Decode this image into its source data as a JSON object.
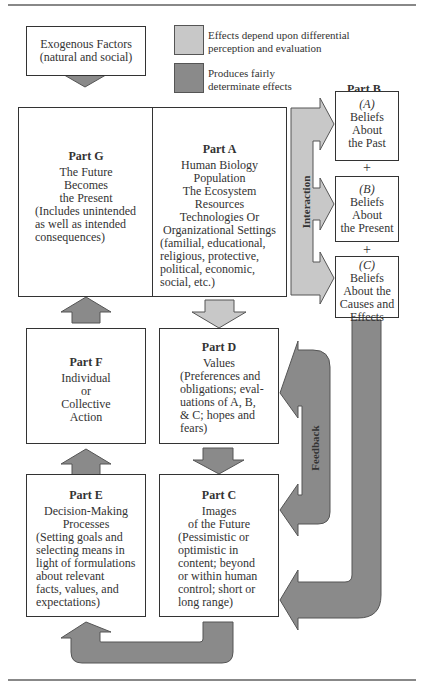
{
  "colors": {
    "light_arrow": "#c8c8c8",
    "dark_arrow": "#8a8a8a",
    "border": "#333333"
  },
  "legend": {
    "light": {
      "icon": "light-gray-swatch",
      "lines": [
        "Effects depend upon differential",
        "perception and evaluation"
      ]
    },
    "dark": {
      "icon": "dark-gray-swatch",
      "lines": [
        "Produces fairly",
        "determinate effects"
      ]
    }
  },
  "exogenous": {
    "lines": [
      "Exogenous Factors",
      "(natural and social)"
    ]
  },
  "part_g": {
    "title": "Part G",
    "lines": [
      "The Future",
      "Becomes",
      "the Present",
      "(Includes unintended",
      "as well as intended",
      "consequences)"
    ]
  },
  "part_a": {
    "title": "Part A",
    "lines": [
      "Human Biology",
      "Population",
      "The Ecosystem",
      "Resources",
      "Technologies Or",
      "Organizational Settings",
      "(familial, educational,",
      "religious, protective,",
      "political, economic,",
      "social, etc.)"
    ]
  },
  "part_b": {
    "title": "Part B",
    "a": {
      "label": "(A)",
      "lines": [
        "Beliefs",
        "About",
        "the Past"
      ]
    },
    "b": {
      "label": "(B)",
      "lines": [
        "Beliefs",
        "About",
        "the Present"
      ]
    },
    "c": {
      "label": "(C)",
      "lines": [
        "Beliefs",
        "About the",
        "Causes and",
        "Effects"
      ]
    },
    "plus": "+"
  },
  "part_f": {
    "title": "Part F",
    "lines": [
      "Individual",
      "or",
      "Collective",
      "Action"
    ]
  },
  "part_d": {
    "title": "Part D",
    "lines": [
      "Values",
      "(Preferences and",
      "obligations; eval-",
      "uations of A, B,",
      "& C; hopes and",
      "fears)"
    ]
  },
  "part_e": {
    "title": "Part E",
    "lines": [
      "Decision-Making",
      "Processes",
      "(Setting goals and",
      "selecting means in",
      "light of formulations",
      "about relevant",
      "facts, values, and",
      "expectations)"
    ]
  },
  "part_c": {
    "title": "Part C",
    "lines": [
      "Images",
      "of the Future",
      "(Pessimistic or",
      "optimistic in",
      "content; beyond",
      "or within human",
      "control; short or",
      "long range)"
    ]
  },
  "labels": {
    "interaction": "Interaction",
    "feedback": "Feedback"
  }
}
